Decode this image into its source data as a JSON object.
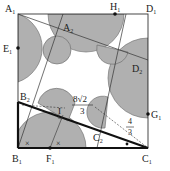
{
  "diagram": {
    "type": "geometry-figure",
    "square": {
      "vertices": [
        "A₁",
        "B₁",
        "C₁",
        "D₁"
      ]
    },
    "inner_quadrilateral": {
      "vertices": [
        "A₂",
        "B₂",
        "C₂",
        "D₂"
      ]
    },
    "side_midpoints": [
      "E₁",
      "F₁",
      "G₁",
      "H₁"
    ],
    "labels": {
      "A1": "A",
      "A1_sub": "1",
      "A2": "A",
      "A2_sub": "2",
      "B1": "B",
      "B1_sub": "1",
      "B2": "B",
      "B2_sub": "2",
      "C1": "C",
      "C1_sub": "1",
      "C2": "C",
      "C2_sub": "2",
      "D1": "D",
      "D1_sub": "1",
      "D2": "D",
      "D2_sub": "2",
      "E1": "E",
      "E1_sub": "1",
      "F1": "F",
      "F1_sub": "1",
      "G1": "G",
      "G1_sub": "1",
      "H1": "H",
      "H1_sub": "1",
      "I": "I"
    },
    "measurements": {
      "length_1_num": "8√2",
      "length_1_den": "3",
      "length_2_num": "4",
      "length_2_den": "3"
    },
    "angle_marks": [
      "×",
      "×"
    ],
    "colors": {
      "shade": "#b0b0b0",
      "line": "#222222",
      "thick_line": "#111111"
    }
  }
}
